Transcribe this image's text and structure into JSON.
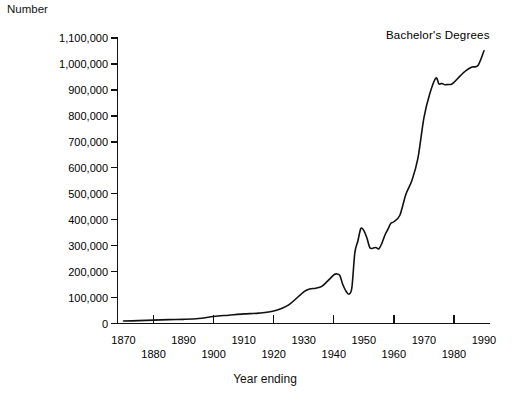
{
  "chart_data": {
    "type": "line",
    "title": "",
    "annotation": "Bachelor's Degrees",
    "ylabel": "Number",
    "xlabel": "Year ending",
    "ylim": [
      0,
      1100000
    ],
    "xlim": [
      1868,
      1992
    ],
    "grid": false,
    "legend_position": "inline-top-right",
    "ytick_labels": [
      "0",
      "100,000",
      "200,000",
      "300,000",
      "400,000",
      "500,000",
      "600,000",
      "700,000",
      "800,000",
      "900,000",
      "1,000,000",
      "1,100,000"
    ],
    "ytick_values": [
      0,
      100000,
      200000,
      300000,
      400000,
      500000,
      600000,
      700000,
      800000,
      900000,
      1000000,
      1100000
    ],
    "xtick_labels": [
      "1870",
      "1880",
      "1890",
      "1900",
      "1910",
      "1920",
      "1930",
      "1940",
      "1950",
      "1960",
      "1970",
      "1980",
      "1990"
    ],
    "xtick_values": [
      1870,
      1880,
      1890,
      1900,
      1910,
      1920,
      1930,
      1940,
      1950,
      1960,
      1970,
      1980,
      1990
    ],
    "series": [
      {
        "name": "Bachelor's Degrees",
        "x": [
          1870,
          1875,
          1880,
          1885,
          1890,
          1895,
          1900,
          1905,
          1910,
          1915,
          1920,
          1925,
          1930,
          1932,
          1934,
          1936,
          1938,
          1940,
          1941,
          1942,
          1943,
          1944,
          1945,
          1946,
          1947,
          1948,
          1949,
          1950,
          1951,
          1952,
          1953,
          1954,
          1955,
          1956,
          1957,
          1958,
          1959,
          1960,
          1962,
          1964,
          1966,
          1968,
          1970,
          1972,
          1974,
          1975,
          1976,
          1977,
          1978,
          1979,
          1980,
          1982,
          1984,
          1986,
          1988,
          1990
        ],
        "values": [
          9400,
          11000,
          13000,
          15000,
          16000,
          19000,
          27000,
          32000,
          37000,
          40000,
          48000,
          72000,
          122000,
          133000,
          136000,
          143000,
          164000,
          187000,
          191000,
          185000,
          150000,
          126000,
          113000,
          136000,
          272000,
          317000,
          366000,
          358000,
          330000,
          292000,
          290000,
          293000,
          288000,
          309000,
          340000,
          363000,
          386000,
          392000,
          417000,
          498000,
          551000,
          636000,
          792000,
          887000,
          946000,
          923000,
          925000,
          920000,
          921000,
          921000,
          929000,
          953000,
          974000,
          988000,
          994000,
          1051000
        ]
      }
    ]
  },
  "figure": {
    "y_axis_title": "Number",
    "x_axis_title": "Year ending",
    "series_annotation": "Bachelor's Degrees"
  }
}
